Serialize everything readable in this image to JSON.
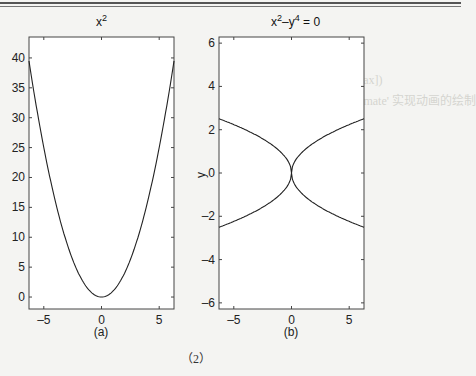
{
  "figure": {
    "caption_number": "（2）",
    "bleed_through_text": [
      "ezplot(fun,[min,max])",
      "ezplot(funx,funy,[tmin,tmax])",
      "ezplot(..., 'animate')% 'animate' 实现动画的绘制"
    ]
  },
  "chart_data": [
    {
      "type": "line",
      "title": "x^2",
      "title_text": "x",
      "title_sup": "2",
      "panel_label": "(a)",
      "xlabel": "",
      "ylabel": "",
      "xlim": [
        -6.2832,
        6.2832
      ],
      "ylim": [
        -2.0,
        43.5
      ],
      "xticks": [
        -5,
        0,
        5
      ],
      "yticks": [
        0,
        5,
        10,
        15,
        20,
        25,
        30,
        35,
        40
      ],
      "grid": false,
      "function": "y = x^2",
      "x": [
        -6.2832,
        -5,
        -4,
        -3,
        -2,
        -1,
        0,
        1,
        2,
        3,
        4,
        5,
        6.2832
      ],
      "y": [
        39.48,
        25,
        16,
        9,
        4,
        1,
        0,
        1,
        4,
        9,
        16,
        25,
        39.48
      ]
    },
    {
      "type": "line",
      "title": "x^2-y^4 = 0",
      "title_parts": [
        "x",
        "2",
        "–y",
        "4",
        " = 0"
      ],
      "panel_label": "(b)",
      "xlabel": "",
      "ylabel": "y",
      "xlim": [
        -6.2832,
        6.2832
      ],
      "ylim": [
        -6.2832,
        6.2832
      ],
      "xticks": [
        -5,
        0,
        5
      ],
      "yticks": [
        -6,
        -4,
        -2,
        0,
        2,
        4,
        6
      ],
      "grid": false,
      "function": "x^2 - y^4 = 0  (y = ±sqrt|x|)",
      "series": [
        {
          "name": "upper",
          "x": [
            -6.2832,
            -4,
            -2,
            -1,
            0,
            1,
            2,
            4,
            6.2832
          ],
          "y": [
            2.507,
            2.0,
            1.414,
            1.0,
            0,
            1.0,
            1.414,
            2.0,
            2.507
          ]
        },
        {
          "name": "lower",
          "x": [
            -6.2832,
            -4,
            -2,
            -1,
            0,
            1,
            2,
            4,
            6.2832
          ],
          "y": [
            -2.507,
            -2.0,
            -1.414,
            -1.0,
            0,
            -1.0,
            -1.414,
            -2.0,
            -2.507
          ]
        }
      ]
    }
  ]
}
